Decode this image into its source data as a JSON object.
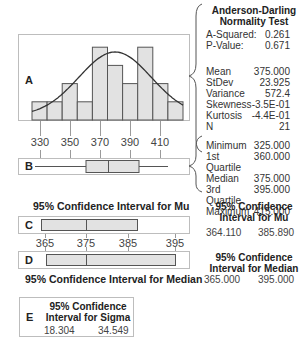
{
  "chart_data": [
    {
      "type": "bar",
      "panel": "A",
      "title": "",
      "xlabel": "",
      "ylabel": "",
      "bin_edges": [
        320,
        330,
        340,
        350,
        360,
        370,
        380,
        390,
        400,
        410,
        420
      ],
      "values": [
        1,
        1,
        2,
        1,
        4,
        3,
        2,
        4,
        2,
        1
      ],
      "overlay": "normal curve (mean 375.000, stdev 23.925)",
      "x_ticks": [
        330,
        350,
        370,
        390,
        410
      ],
      "grid": false
    },
    {
      "type": "boxplot",
      "panel": "B",
      "min": 325.0,
      "q1": 360.0,
      "median": 375.0,
      "q3": 395.0,
      "max": 415.0
    },
    {
      "type": "interval",
      "panel": "C",
      "title": "95% Confidence Interval for Mu",
      "low": 364.11,
      "high": 385.89,
      "center": 375.0,
      "x_ticks": [
        365,
        375,
        385,
        395
      ]
    },
    {
      "type": "interval",
      "panel": "D",
      "title": "95% Confidence Interval for Median",
      "low": 365.0,
      "high": 395.0,
      "center": 375.0
    }
  ],
  "panels": {
    "a": "A",
    "b": "B",
    "c": "C",
    "d": "D",
    "e": "E"
  },
  "axis": {
    "hist_ticks": [
      "330",
      "350",
      "370",
      "390",
      "410"
    ],
    "ci_ticks": [
      "365",
      "375",
      "385",
      "395"
    ]
  },
  "normality": {
    "heading1": "Anderson-Darling",
    "heading2": "Normality Test",
    "rows": [
      {
        "label": "A-Squared:",
        "value": "0.261"
      },
      {
        "label": "P-Value:",
        "value": "0.671"
      }
    ]
  },
  "descriptive": {
    "rows": [
      {
        "label": "Mean",
        "value": "375.000"
      },
      {
        "label": "StDev",
        "value": "23.925"
      },
      {
        "label": "Variance",
        "value": "572.4"
      },
      {
        "label": "Skewness",
        "value": "-3.5E-01"
      },
      {
        "label": "Kurtosis",
        "value": "-4.4E-01"
      },
      {
        "label": "N",
        "value": "21"
      }
    ]
  },
  "quartiles": {
    "rows": [
      {
        "label": "Minimum",
        "value": "325.000"
      },
      {
        "label": "1st Quartile",
        "value": "360.000"
      },
      {
        "label": "Median",
        "value": "375.000"
      },
      {
        "label": "3rd Quartile",
        "value": "395.000"
      },
      {
        "label": "Maximum",
        "value": "415.000"
      }
    ]
  },
  "ci_mu": {
    "title": "95% Confidence Interval for Mu",
    "heading1": "95% Confidence",
    "heading2": "Interval for Mu",
    "low": "364.110",
    "high": "385.890"
  },
  "ci_median": {
    "title": "95% Confidence Interval for Median",
    "heading1": "95% Confidence",
    "heading2": "Interval for Median",
    "low": "365.000",
    "high": "395.000"
  },
  "ci_sigma": {
    "heading1": "95% Confidence",
    "heading2": "Interval for Sigma",
    "low": "18.304",
    "high": "34.549"
  },
  "colors": {
    "bar_fill": "#e2e2e2",
    "bar_stroke": "#555555",
    "curve": "#333333",
    "border": "#bdbdbd"
  }
}
